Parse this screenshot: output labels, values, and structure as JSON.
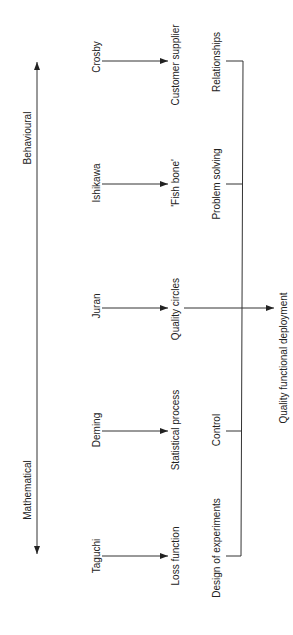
{
  "diagram": {
    "axis": {
      "top_label": "Behavioural",
      "bottom_label": "Mathematical"
    },
    "rows": [
      {
        "name": "Crosby",
        "concept": "Customer supplier",
        "theme": "Relationships"
      },
      {
        "name": "Ishikawa",
        "concept": "'Fish bone'",
        "theme": "Problem solving"
      },
      {
        "name": "Juran",
        "concept": "Quality circles",
        "theme": ""
      },
      {
        "name": "Deming",
        "concept": "Statistical process",
        "theme": "Control"
      },
      {
        "name": "Taguchi",
        "concept": "Loss function",
        "theme": "Design of experiments"
      }
    ],
    "outcome": "Quality functional deployment",
    "line_color": "#333333"
  }
}
